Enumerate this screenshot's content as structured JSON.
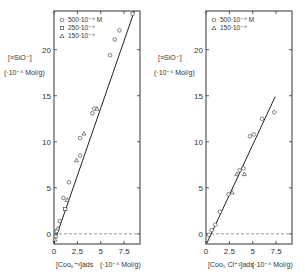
{
  "chart_data": [
    {
      "type": "scatter",
      "panel": "left",
      "ylabel": "[≡SiO⁻]",
      "ylabel_unit": "(·10⁻⁶ Mol/g)",
      "xlabel": "[Coo₆⁺³]ads",
      "xlabel_unit": "(·10⁻⁶ Mol/g)",
      "xlim": [
        0,
        9.2
      ],
      "ylim": [
        -1.1,
        24.2
      ],
      "xticks": [
        "0",
        "2.5",
        "5",
        "7.5"
      ],
      "yticks": [
        "0",
        "5",
        "10",
        "15",
        "20"
      ],
      "reference_line": {
        "y": 0,
        "style": "dashed"
      },
      "fit_line": {
        "x0": 0.0,
        "y0": -1.0,
        "x1": 8.6,
        "y1": 24.2
      },
      "legend": [
        {
          "label": "500·10⁻⁶ M",
          "marker": "circle"
        },
        {
          "label": "250·10⁻⁶",
          "marker": "square"
        },
        {
          "label": "150·10⁻⁶",
          "marker": "triangle"
        }
      ],
      "series": [
        {
          "name": "500·10⁻⁶ M",
          "marker": "circle",
          "points": [
            [
              0.2,
              -0.3
            ],
            [
              0.3,
              0.3
            ],
            [
              0.6,
              1.4
            ],
            [
              1.0,
              3.9
            ],
            [
              1.6,
              5.6
            ],
            [
              2.8,
              8.5
            ],
            [
              2.8,
              10.4
            ],
            [
              4.1,
              13.1
            ],
            [
              4.3,
              13.6
            ],
            [
              6.0,
              19.4
            ],
            [
              6.5,
              21.1
            ],
            [
              7.0,
              22.1
            ],
            [
              8.4,
              23.9
            ]
          ]
        },
        {
          "name": "250·10⁻⁶",
          "marker": "square",
          "points": [
            [
              1.2,
              2.7
            ]
          ]
        },
        {
          "name": "150·10⁻⁶",
          "marker": "triangle",
          "points": [
            [
              0.1,
              -0.6
            ],
            [
              0.4,
              0.6
            ],
            [
              1.4,
              3.7
            ],
            [
              2.4,
              8.0
            ],
            [
              3.2,
              10.9
            ],
            [
              4.6,
              13.6
            ]
          ]
        }
      ]
    },
    {
      "type": "scatter",
      "panel": "right",
      "ylabel": "[≡SiO⁻]",
      "ylabel_unit": "(·10⁻⁶ Mol/g)",
      "xlabel": "[Coo₅ Cl⁺²]ads",
      "xlabel_unit": "(·10⁻⁶ Mol/g)",
      "xlim": [
        0,
        9.2
      ],
      "ylim": [
        -1.1,
        24.2
      ],
      "xticks": [
        "0",
        "2.5",
        "5",
        "7.5"
      ],
      "yticks": [
        "0",
        "5",
        "10",
        "15",
        "20"
      ],
      "reference_line": {
        "y": 0,
        "style": "dashed"
      },
      "fit_line": {
        "x0": 0.1,
        "y0": -1.0,
        "x1": 7.4,
        "y1": 14.9
      },
      "legend": [
        {
          "label": "500·10⁻⁶ M",
          "marker": "circle"
        },
        {
          "label": "150·10⁻⁶",
          "marker": "triangle"
        }
      ],
      "series": [
        {
          "name": "500·10⁻⁶ M",
          "marker": "circle",
          "points": [
            [
              0.3,
              -0.1
            ],
            [
              0.6,
              0.4
            ],
            [
              1.0,
              1.0
            ],
            [
              1.5,
              2.4
            ],
            [
              2.4,
              4.3
            ],
            [
              3.6,
              6.9
            ],
            [
              4.0,
              7.1
            ],
            [
              4.7,
              10.6
            ],
            [
              5.1,
              10.8
            ],
            [
              6.0,
              12.5
            ],
            [
              7.3,
              13.2
            ]
          ]
        },
        {
          "name": "150·10⁻⁶",
          "marker": "triangle",
          "points": [
            [
              2.8,
              4.5
            ],
            [
              3.3,
              6.5
            ],
            [
              4.1,
              6.5
            ]
          ]
        }
      ]
    }
  ]
}
